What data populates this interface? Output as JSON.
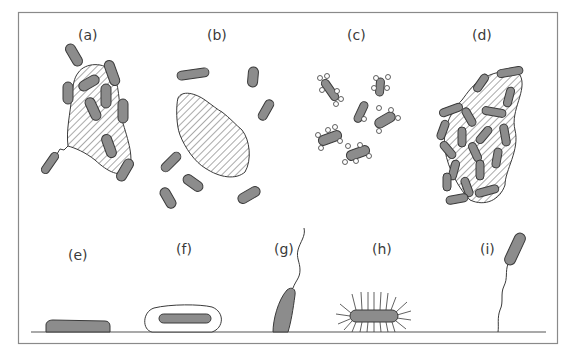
{
  "diagram": {
    "panels": [
      {
        "id": "a",
        "label": "(a)",
        "content": "rod cells attached around a hatched particle, one via a filament"
      },
      {
        "id": "b",
        "label": "(b)",
        "content": "hatched particle with free rod cells dispersed around it"
      },
      {
        "id": "c",
        "label": "(c)",
        "content": "rod cells bearing small round appendages"
      },
      {
        "id": "d",
        "label": "(d)",
        "content": "dense aggregate of rod cells and hatched particles"
      },
      {
        "id": "e",
        "label": "(e)",
        "content": "cell lying flat on surface"
      },
      {
        "id": "f",
        "label": "(f)",
        "content": "cell enclosed in capsule on surface"
      },
      {
        "id": "g",
        "label": "(g)",
        "content": "cell attached at one pole with flagellum"
      },
      {
        "id": "h",
        "label": "(h)",
        "content": "cell with many pili/fimbriae on surface"
      },
      {
        "id": "i",
        "label": "(i)",
        "content": "cell tethered to surface by a filament"
      }
    ],
    "colors": {
      "cell_fill": "#8c8c8c",
      "outline": "#3a3a3a",
      "frame": "#8a8a8a",
      "background": "#ffffff"
    }
  }
}
